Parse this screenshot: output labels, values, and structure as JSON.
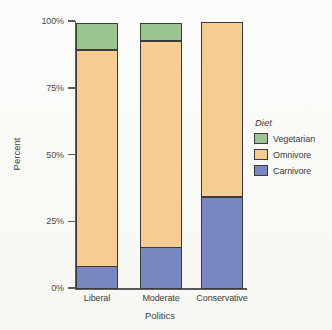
{
  "chart_data": {
    "type": "bar",
    "subtype": "stacked-percent",
    "title": "",
    "xlabel": "Politics",
    "ylabel": "Percent",
    "categories": [
      "Liberal",
      "Moderate",
      "Conservative"
    ],
    "series": [
      {
        "name": "Carnivore",
        "color": "#7a86c0",
        "values": [
          8.6,
          15.7,
          34.6
        ]
      },
      {
        "name": "Omnivore",
        "color": "#f5cd92",
        "values": [
          81.3,
          77.7,
          65.4
        ]
      },
      {
        "name": "Vegetarian",
        "color": "#9cc493",
        "values": [
          10.1,
          6.6,
          0.0
        ]
      }
    ],
    "stack_order_bottom_to_top": [
      "Carnivore",
      "Omnivore",
      "Vegetarian"
    ],
    "ylim": [
      0,
      100
    ],
    "yticks": [
      "0%",
      "25%",
      "50%",
      "75%",
      "100%"
    ],
    "ytick_values": [
      0,
      25,
      50,
      75,
      100
    ],
    "grid": false,
    "legend": {
      "title": "Diet",
      "position": "right",
      "entries": [
        "Vegetarian",
        "Omnivore",
        "Carnivore"
      ]
    }
  },
  "axes": {
    "y_title": "Percent",
    "x_title": "Politics",
    "y_ticks": [
      {
        "label": "100%",
        "value": 100
      },
      {
        "label": "75%",
        "value": 75
      },
      {
        "label": "50%",
        "value": 50
      },
      {
        "label": "25%",
        "value": 25
      },
      {
        "label": "0%",
        "value": 0
      }
    ]
  },
  "legend": {
    "title": "Diet",
    "items": [
      {
        "label": "Vegetarian",
        "color": "#9cc493"
      },
      {
        "label": "Omnivore",
        "color": "#f5cd92"
      },
      {
        "label": "Carnivore",
        "color": "#7a86c0"
      }
    ]
  },
  "bars": [
    {
      "category": "Liberal",
      "segments": [
        {
          "name": "Carnivore",
          "percent": 8.6,
          "color": "#7a86c0"
        },
        {
          "name": "Omnivore",
          "percent": 81.3,
          "color": "#f5cd92"
        },
        {
          "name": "Vegetarian",
          "percent": 10.1,
          "color": "#9cc493"
        }
      ]
    },
    {
      "category": "Moderate",
      "segments": [
        {
          "name": "Carnivore",
          "percent": 15.7,
          "color": "#7a86c0"
        },
        {
          "name": "Omnivore",
          "percent": 77.7,
          "color": "#f5cd92"
        },
        {
          "name": "Vegetarian",
          "percent": 6.6,
          "color": "#9cc493"
        }
      ]
    },
    {
      "category": "Conservative",
      "segments": [
        {
          "name": "Carnivore",
          "percent": 34.6,
          "color": "#7a86c0"
        },
        {
          "name": "Omnivore",
          "percent": 65.4,
          "color": "#f5cd92"
        },
        {
          "name": "Vegetarian",
          "percent": 0.0,
          "color": "#9cc493"
        }
      ]
    }
  ],
  "geometry": {
    "plot_left": 76,
    "plot_top": 21,
    "plot_height": 267,
    "bar_width": 42,
    "bar_lefts": [
      76,
      140,
      201
    ]
  }
}
